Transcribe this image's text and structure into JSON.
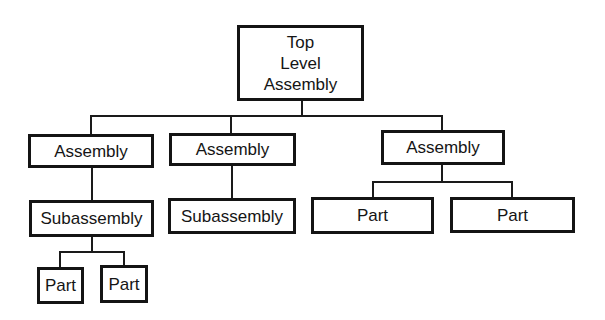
{
  "diagram": {
    "type": "hierarchy-tree",
    "root": {
      "label_lines": [
        "Top",
        "Level",
        "Assembly"
      ]
    },
    "level1": [
      {
        "label": "Assembly"
      },
      {
        "label": "Assembly"
      },
      {
        "label": "Assembly"
      }
    ],
    "level2": [
      {
        "label": "Subassembly",
        "parent": 0
      },
      {
        "label": "Subassembly",
        "parent": 1
      },
      {
        "label": "Part",
        "parent": 2
      },
      {
        "label": "Part",
        "parent": 2
      }
    ],
    "level3": [
      {
        "label": "Part",
        "parent": 0
      },
      {
        "label": "Part",
        "parent": 0
      }
    ],
    "colors": {
      "stroke": "#141414",
      "background": "#ffffff",
      "text": "#151515"
    }
  }
}
